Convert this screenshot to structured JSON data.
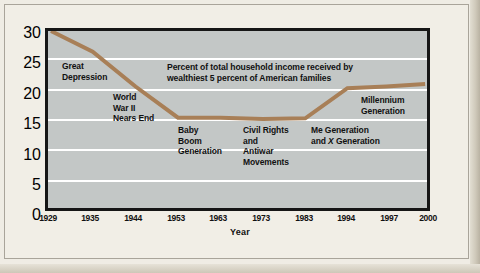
{
  "chart_data": {
    "type": "line",
    "title": "",
    "xlabel": "Year",
    "ylabel": "Percent",
    "ylim": [
      0,
      30
    ],
    "yticks": [
      0,
      5,
      10,
      15,
      20,
      25,
      30
    ],
    "grid": true,
    "legend": "none",
    "x": [
      1929,
      1935,
      1944,
      1953,
      1963,
      1973,
      1983,
      1994,
      1997,
      2000
    ],
    "categories": [
      "1929",
      "1935",
      "1944",
      "1953",
      "1963",
      "1973",
      "1983",
      "1994",
      "1997",
      "2000"
    ],
    "series": [
      {
        "name": "Percent of total household income received by wealthiest 5 percent of American families",
        "color": "#a87f57",
        "values": [
          30.0,
          26.5,
          20.6,
          15.3,
          15.3,
          15.1,
          15.2,
          20.3,
          20.6,
          21.0
        ]
      }
    ],
    "annotations": [
      {
        "id": "great-depression",
        "text": "Great\nDepression",
        "x": 1931,
        "y": 24.5
      },
      {
        "id": "world-war-ii",
        "text": "World\nWar II\nNears End",
        "x": 1941,
        "y": 19.5
      },
      {
        "id": "series-note",
        "text": "Percent of total household income received by\nwealthiest 5 percent of American families",
        "x": 1954,
        "y": 25.5
      },
      {
        "id": "baby-boom",
        "text": "Baby\nBoom\nGeneration",
        "x": 1954,
        "y": 13.6
      },
      {
        "id": "civil-rights",
        "text": "Civil Rights\nand\nAntiwar\nMovements",
        "x": 1965,
        "y": 13.6
      },
      {
        "id": "me-generation",
        "text": "Me Generation\nand X Generation",
        "x": 1977,
        "y": 13.6
      },
      {
        "id": "millennium",
        "text": "Millennium\nGeneration",
        "x": 1995,
        "y": 18.2
      }
    ]
  },
  "labels": {
    "ylabel": "Percent",
    "xlabel": "Year",
    "yticks": [
      "30",
      "25",
      "20",
      "15",
      "10",
      "5",
      "0"
    ],
    "xticks": [
      "1929",
      "1935",
      "1944",
      "1953",
      "1963",
      "1973",
      "1983",
      "1994",
      "1997",
      "2000"
    ]
  },
  "annotations": {
    "great_depression_l1": "Great",
    "great_depression_l2": "Depression",
    "wwii_l1": "World",
    "wwii_l2": "War II",
    "wwii_l3": "Nears End",
    "note_l1": "Percent of total household income received by",
    "note_l2": "wealthiest 5 percent of American families",
    "baby_l1": "Baby",
    "baby_l2": "Boom",
    "baby_l3": "Generation",
    "civil_l1": "Civil Rights",
    "civil_l2": "and",
    "civil_l3": "Antiwar",
    "civil_l4": "Movements",
    "me_l1": "Me Generation",
    "me_l2a": "and ",
    "me_l2b": "X",
    "me_l2c": " Generation",
    "millennium_l1": "Millennium",
    "millennium_l2": "Generation"
  },
  "colors": {
    "line": "#a87f57",
    "plot_bg": "#c3c7c6",
    "page_bg": "#f1eee6",
    "frame": "#161616",
    "gridline": "#ffffff"
  }
}
